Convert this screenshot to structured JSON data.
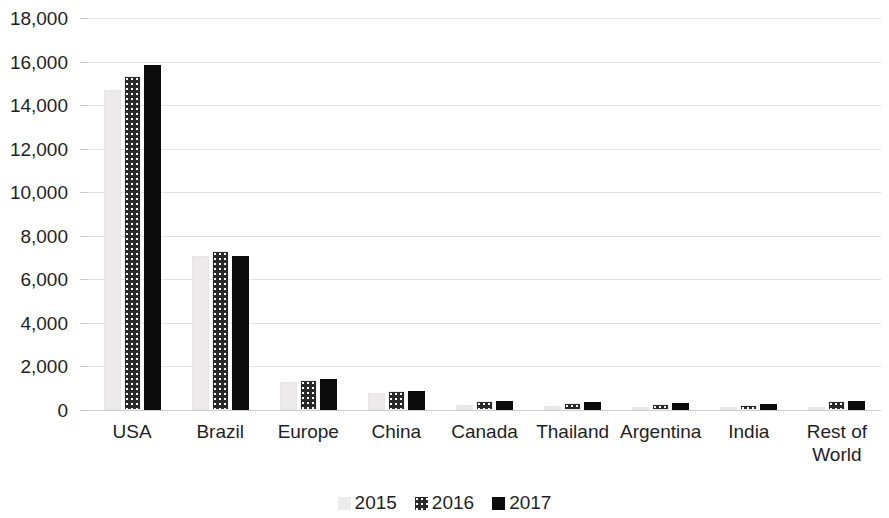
{
  "chart_data": {
    "type": "bar",
    "title": "",
    "subtitle": "",
    "xlabel": "",
    "ylabel": "",
    "ylim": [
      0,
      18000
    ],
    "ytick_labels": [
      "18,000",
      "16,000",
      "14,000",
      "12,000",
      "10,000",
      "8,000",
      "6,000",
      "4,000",
      "2,000",
      "0"
    ],
    "ytick_values": [
      18000,
      16000,
      14000,
      12000,
      10000,
      8000,
      6000,
      4000,
      2000,
      0
    ],
    "ytick_interval": 2000,
    "grid": true,
    "grid_axis": "y",
    "legend_position": "bottom",
    "categories": [
      "USA",
      "Brazil",
      "Europe",
      "China",
      "Canada",
      "Thailand",
      "Argentina",
      "India",
      "Rest of World"
    ],
    "category_label_lines": [
      [
        "USA"
      ],
      [
        "Brazil"
      ],
      [
        "Europe"
      ],
      [
        "China"
      ],
      [
        "Canada"
      ],
      [
        "Thailand"
      ],
      [
        "Argentina"
      ],
      [
        "India"
      ],
      [
        "Rest of",
        "World"
      ]
    ],
    "series": [
      {
        "name": "2015",
        "style": "light-gray-speckle",
        "color": "#ECEAEA",
        "values": [
          14700,
          7050,
          1300,
          800,
          250,
          200,
          150,
          130,
          150
        ]
      },
      {
        "name": "2016",
        "style": "dark-dotted",
        "color": "#2A2A2A",
        "values": [
          15350,
          7300,
          1380,
          870,
          420,
          340,
          260,
          230,
          420
        ]
      },
      {
        "name": "2017",
        "style": "solid-black",
        "color": "#0B0B0B",
        "values": [
          15850,
          7050,
          1420,
          880,
          430,
          350,
          330,
          260,
          430
        ]
      }
    ]
  },
  "legend": {
    "items": [
      {
        "label": "2015",
        "series_index": 0
      },
      {
        "label": "2016",
        "series_index": 1
      },
      {
        "label": "2017",
        "series_index": 2
      }
    ]
  }
}
